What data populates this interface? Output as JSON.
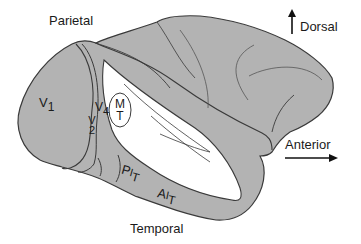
{
  "diagram": {
    "colors": {
      "cortex_fill": "#b3b3b3",
      "sulcus_fill": "#ffffff",
      "outline": "#3a3a3a",
      "text": "#1a1a1a",
      "background": "#ffffff"
    },
    "lobe_labels": {
      "parietal": "Parietal",
      "temporal": "Temporal"
    },
    "orientation": {
      "dorsal": "Dorsal",
      "anterior": "Anterior"
    },
    "areas": {
      "v1": {
        "main": "V",
        "sub": "1"
      },
      "v2": {
        "main": "V",
        "sub": "2"
      },
      "v4": {
        "main": "V",
        "sub": "4"
      },
      "mt": {
        "top": "M",
        "bottom": "T"
      },
      "pit": {
        "main": "P",
        "sub1": "I",
        "sub2": "T"
      },
      "ait": {
        "main": "A",
        "sub1": "I",
        "sub2": "T"
      }
    }
  }
}
